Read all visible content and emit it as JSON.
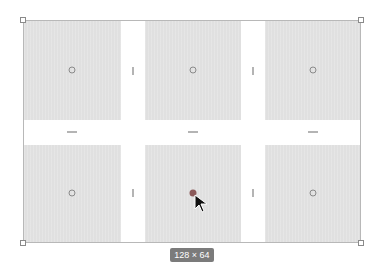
{
  "canvas": {
    "frame": {
      "x": 23,
      "y": 20,
      "width": 338,
      "height": 223
    },
    "grid": {
      "columns": 3,
      "rows": 2
    },
    "cells": [
      {
        "row": 1,
        "col": 1,
        "x": 24,
        "y": 21,
        "w": 97,
        "h": 99
      },
      {
        "row": 1,
        "col": 2,
        "x": 145,
        "y": 21,
        "w": 96,
        "h": 99
      },
      {
        "row": 1,
        "col": 3,
        "x": 265,
        "y": 21,
        "w": 95,
        "h": 99
      },
      {
        "row": 2,
        "col": 1,
        "x": 24,
        "y": 145,
        "w": 97,
        "h": 97
      },
      {
        "row": 2,
        "col": 2,
        "x": 145,
        "y": 145,
        "w": 96,
        "h": 97
      },
      {
        "row": 2,
        "col": 3,
        "x": 265,
        "y": 145,
        "w": 95,
        "h": 97
      }
    ],
    "cell_color": "#e0e0e0",
    "size_badge": "128 × 64",
    "selected_dot_color": "#8b5a5a"
  }
}
